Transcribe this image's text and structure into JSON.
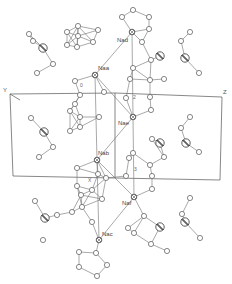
{
  "figure": {
    "axes": {
      "y_label": "Y",
      "z_label": "Z"
    },
    "atom_labels": [
      {
        "text": "Nad",
        "x": 117,
        "y": 42
      },
      {
        "text": "Naa",
        "x": 98,
        "y": 70
      },
      {
        "text": "Nae",
        "x": 118,
        "y": 125
      },
      {
        "text": "Nab",
        "x": 98,
        "y": 155
      },
      {
        "text": "Naf",
        "x": 122,
        "y": 205
      },
      {
        "text": "Nac",
        "x": 102,
        "y": 236
      }
    ],
    "small_labels": [
      {
        "text": "0",
        "x": 80,
        "y": 87
      },
      {
        "text": "X",
        "x": 88,
        "y": 182
      },
      {
        "text": "2",
        "x": 133,
        "y": 99
      },
      {
        "text": "3",
        "x": 134,
        "y": 171
      }
    ],
    "unit_cell": {
      "top_left": [
        10,
        94
      ],
      "top_right": [
        222,
        97
      ],
      "bottom_left": [
        13,
        176
      ],
      "bottom_right": [
        220,
        180
      ],
      "mid_top": [
        115,
        93
      ],
      "mid_bottom": [
        115,
        178
      ]
    },
    "sodium_centers": [
      {
        "name": "Nad",
        "x": 132,
        "y": 32
      },
      {
        "name": "Naa",
        "x": 95,
        "y": 75
      },
      {
        "name": "Nae",
        "x": 133,
        "y": 117
      },
      {
        "name": "Nab",
        "x": 97,
        "y": 160
      },
      {
        "name": "Naf",
        "x": 134,
        "y": 197
      },
      {
        "name": "Nac",
        "x": 99,
        "y": 240
      }
    ],
    "heavy_atoms": [
      {
        "x": 43,
        "y": 48
      },
      {
        "x": 160,
        "y": 56
      },
      {
        "x": 185,
        "y": 58
      },
      {
        "x": 45,
        "y": 218
      },
      {
        "x": 160,
        "y": 227
      },
      {
        "x": 185,
        "y": 222
      },
      {
        "x": 44,
        "y": 132
      },
      {
        "x": 160,
        "y": 143
      },
      {
        "x": 186,
        "y": 143
      }
    ],
    "light_atoms": [
      {
        "x": 29,
        "y": 34
      },
      {
        "x": 33,
        "y": 41
      },
      {
        "x": 67,
        "y": 45
      },
      {
        "x": 53,
        "y": 64
      },
      {
        "x": 37,
        "y": 73
      },
      {
        "x": 78,
        "y": 26
      },
      {
        "x": 78,
        "y": 36
      },
      {
        "x": 98,
        "y": 30
      },
      {
        "x": 67,
        "y": 32
      },
      {
        "x": 77,
        "y": 47
      },
      {
        "x": 93,
        "y": 42
      },
      {
        "x": 133,
        "y": 10
      },
      {
        "x": 122,
        "y": 17
      },
      {
        "x": 149,
        "y": 17
      },
      {
        "x": 149,
        "y": 29
      },
      {
        "x": 142,
        "y": 42
      },
      {
        "x": 190,
        "y": 32
      },
      {
        "x": 181,
        "y": 41
      },
      {
        "x": 199,
        "y": 73
      },
      {
        "x": 164,
        "y": 79
      },
      {
        "x": 151,
        "y": 60
      },
      {
        "x": 133,
        "y": 68
      },
      {
        "x": 150,
        "y": 80
      },
      {
        "x": 130,
        "y": 79
      },
      {
        "x": 75,
        "y": 81
      },
      {
        "x": 80,
        "y": 95
      },
      {
        "x": 104,
        "y": 92
      },
      {
        "x": 75,
        "y": 104
      },
      {
        "x": 126,
        "y": 98
      },
      {
        "x": 150,
        "y": 97
      },
      {
        "x": 151,
        "y": 110
      },
      {
        "x": 31,
        "y": 118
      },
      {
        "x": 70,
        "y": 111
      },
      {
        "x": 53,
        "y": 147
      },
      {
        "x": 39,
        "y": 157
      },
      {
        "x": 80,
        "y": 117
      },
      {
        "x": 80,
        "y": 127
      },
      {
        "x": 99,
        "y": 117
      },
      {
        "x": 70,
        "y": 131
      },
      {
        "x": 190,
        "y": 117
      },
      {
        "x": 181,
        "y": 128
      },
      {
        "x": 199,
        "y": 152
      },
      {
        "x": 164,
        "y": 157
      },
      {
        "x": 152,
        "y": 139
      },
      {
        "x": 133,
        "y": 153
      },
      {
        "x": 150,
        "y": 165
      },
      {
        "x": 129,
        "y": 158
      },
      {
        "x": 77,
        "y": 168
      },
      {
        "x": 98,
        "y": 174
      },
      {
        "x": 106,
        "y": 178
      },
      {
        "x": 77,
        "y": 186
      },
      {
        "x": 92,
        "y": 190
      },
      {
        "x": 126,
        "y": 176
      },
      {
        "x": 152,
        "y": 176
      },
      {
        "x": 152,
        "y": 189
      },
      {
        "x": 35,
        "y": 201
      },
      {
        "x": 57,
        "y": 215
      },
      {
        "x": 43,
        "y": 240
      },
      {
        "x": 72,
        "y": 212
      },
      {
        "x": 81,
        "y": 195
      },
      {
        "x": 82,
        "y": 207
      },
      {
        "x": 102,
        "y": 199
      },
      {
        "x": 92,
        "y": 222
      },
      {
        "x": 190,
        "y": 198
      },
      {
        "x": 182,
        "y": 214
      },
      {
        "x": 200,
        "y": 238
      },
      {
        "x": 167,
        "y": 251
      },
      {
        "x": 144,
        "y": 216
      },
      {
        "x": 134,
        "y": 233
      },
      {
        "x": 151,
        "y": 244
      },
      {
        "x": 128,
        "y": 228
      },
      {
        "x": 79,
        "y": 252
      },
      {
        "x": 79,
        "y": 267
      },
      {
        "x": 97,
        "y": 276
      },
      {
        "x": 107,
        "y": 265
      },
      {
        "x": 96,
        "y": 253
      }
    ]
  }
}
